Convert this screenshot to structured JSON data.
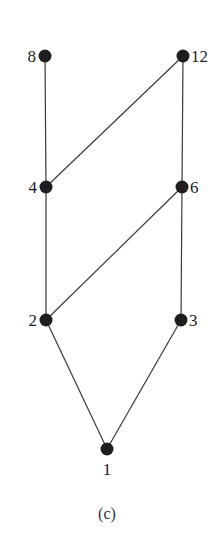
{
  "diagram": {
    "type": "hasse-diagram",
    "caption": "(c)",
    "nodes": [
      {
        "id": "8",
        "label": "8",
        "x": 45,
        "y": 56,
        "label_side": "left"
      },
      {
        "id": "12",
        "label": "12",
        "x": 183,
        "y": 56,
        "label_side": "right"
      },
      {
        "id": "4",
        "label": "4",
        "x": 46,
        "y": 187,
        "label_side": "left"
      },
      {
        "id": "6",
        "label": "6",
        "x": 182,
        "y": 187,
        "label_side": "right"
      },
      {
        "id": "2",
        "label": "2",
        "x": 46,
        "y": 320,
        "label_side": "left"
      },
      {
        "id": "3",
        "label": "3",
        "x": 181,
        "y": 320,
        "label_side": "right"
      },
      {
        "id": "1",
        "label": "1",
        "x": 107,
        "y": 449,
        "label_side": "below"
      }
    ],
    "edges": [
      {
        "from": "8",
        "to": "4"
      },
      {
        "from": "12",
        "to": "4"
      },
      {
        "from": "12",
        "to": "6"
      },
      {
        "from": "4",
        "to": "2"
      },
      {
        "from": "6",
        "to": "2"
      },
      {
        "from": "6",
        "to": "3"
      },
      {
        "from": "2",
        "to": "1"
      },
      {
        "from": "3",
        "to": "1"
      }
    ],
    "colors": {
      "node": "#1e1e1e",
      "edge": "#3a3a3a",
      "text": "#222222",
      "background": "#ffffff"
    }
  }
}
